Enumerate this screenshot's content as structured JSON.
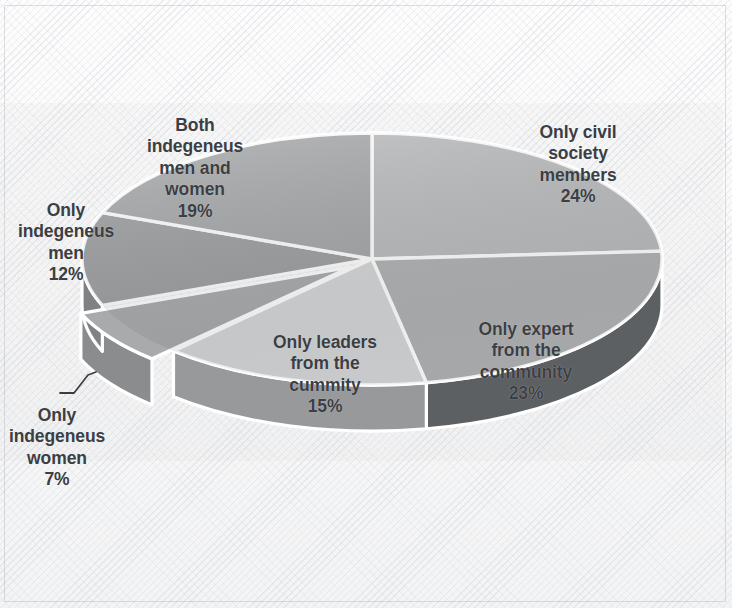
{
  "figure": {
    "kind": "3d-pie-chart",
    "background": "#f7f7f8",
    "label_color": "#3b3e42",
    "separator_color": "#ffffff",
    "border_color": "#969ba2"
  },
  "chart_data": {
    "type": "pie",
    "title": "",
    "subtitle": "",
    "xlabel": "",
    "ylabel": "",
    "legend_position": "none",
    "grid": false,
    "three_d": true,
    "start_angle_deg": 0,
    "direction": "clockwise",
    "categories": [
      "Only civil society members",
      "Only expert from the community",
      "Only leaders from the cummity",
      "Only indegeneus women",
      "Only indegeneus men",
      "Both indegeneus men and women"
    ],
    "values": [
      24,
      23,
      15,
      7,
      12,
      19
    ],
    "value_suffix": "%",
    "colors": [
      "#b9bbbd",
      "#b0b2b4",
      "#d5d6d7",
      "#a8aaac",
      "#9c9ea0",
      "#a4a6a8"
    ],
    "side_colors": [
      "#8e9092",
      "#5d6063",
      "#97999b",
      "#8a8c8e",
      "#7f8183",
      "#86888a"
    ],
    "exploded": [
      false,
      false,
      false,
      true,
      false,
      false
    ],
    "slices": [
      {
        "label": "Only civil society members",
        "label_text": "Only civil\nsociety\nmembers",
        "value": 24,
        "value_text": "24%",
        "color": "#b9bbbd",
        "side_color": "#8e9092",
        "label_placement": "outside-right"
      },
      {
        "label": "Only expert from the community",
        "label_text": "Only expert\nfrom the\ncommunity",
        "value": 23,
        "value_text": "23%",
        "color": "#b0b2b4",
        "side_color": "#5d6063",
        "label_placement": "inside"
      },
      {
        "label": "Only leaders from the cummity",
        "label_text": "Only leaders\nfrom the\ncummity",
        "value": 15,
        "value_text": "15%",
        "color": "#d5d6d7",
        "side_color": "#97999b",
        "label_placement": "inside"
      },
      {
        "label": "Only indegeneus women",
        "label_text": "Only\nindegeneus\nwomen",
        "value": 7,
        "value_text": "7%",
        "color": "#a8aaac",
        "side_color": "#8a8c8e",
        "label_placement": "outside-left-with-leader"
      },
      {
        "label": "Only indegeneus men",
        "label_text": "Only\nindegeneus\nmen",
        "value": 12,
        "value_text": "12%",
        "color": "#9c9ea0",
        "side_color": "#7f8183",
        "label_placement": "outside-left"
      },
      {
        "label": "Both indegeneus men and women",
        "label_text": "Both\nindegeneus\nmen and\nwomen",
        "value": 19,
        "value_text": "19%",
        "color": "#a4a6a8",
        "side_color": "#86888a",
        "label_placement": "outside-top-left"
      }
    ]
  }
}
